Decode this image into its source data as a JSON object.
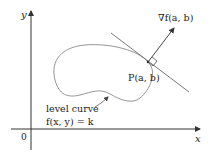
{
  "diagram": {
    "axes": {
      "x_label": "x",
      "y_label": "y",
      "origin_label": "0"
    },
    "gradient_label": "∇f(a, b)",
    "point_label": "P(a, b)",
    "curve_label_line1": "level curve",
    "curve_label_line2": "f(x, y) = k",
    "colors": {
      "axis": "#333333",
      "curve": "#8a8a8a",
      "tangent": "#6a6a6a",
      "text": "#222222"
    }
  }
}
